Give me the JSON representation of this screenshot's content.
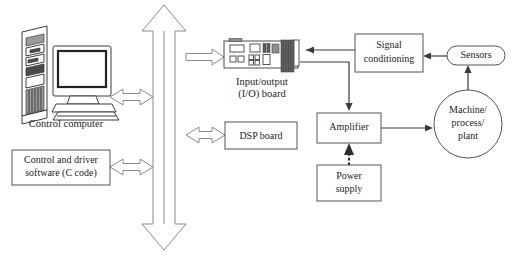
{
  "diagram": {
    "background_color": "#ffffff",
    "line_color": "#3a3a3a",
    "box_stroke_color": "#555555",
    "hollow_arrow_stroke": "#8a8a8a",
    "text_color": "#1d1d1d",
    "nodes": {
      "control_computer": {
        "label": "Control computer",
        "shape": "illustration-tower-and-monitor"
      },
      "control_software": {
        "label_line1": "Control and driver",
        "label_line2": "software (C code)",
        "shape": "rectangle"
      },
      "io_board": {
        "caption_line1": "Input/output",
        "caption_line2": "(I/O) board",
        "shape": "illustration-pcb-card"
      },
      "dsp_board": {
        "label": "DSP board",
        "shape": "rectangle"
      },
      "signal_conditioning": {
        "label_line1": "Signal",
        "label_line2": "conditioning",
        "shape": "rectangle"
      },
      "sensors": {
        "label": "Sensors",
        "shape": "stadium"
      },
      "amplifier": {
        "label": "Amplifier",
        "shape": "rectangle"
      },
      "power_supply": {
        "label_line1": "Power",
        "label_line2": "supply",
        "shape": "rectangle"
      },
      "machine": {
        "label_line1": "Machine/",
        "label_line2": "process/",
        "label_line3": "plant",
        "shape": "circle"
      },
      "system_bus": {
        "label": "",
        "shape": "vertical-double-headed-hollow-arrow"
      }
    },
    "connections": [
      {
        "from": "control_computer",
        "to": "system_bus",
        "style": "hollow-double-arrow",
        "orientation": "horizontal"
      },
      {
        "from": "control_software",
        "to": "system_bus",
        "style": "hollow-double-arrow",
        "orientation": "horizontal"
      },
      {
        "from": "system_bus",
        "to": "io_board",
        "style": "hollow-arrow",
        "orientation": "horizontal",
        "direction": "right"
      },
      {
        "from": "dsp_board",
        "to": "system_bus",
        "style": "hollow-double-arrow",
        "orientation": "horizontal"
      },
      {
        "from": "signal_conditioning",
        "to": "io_board",
        "style": "solid-arrow",
        "direction": "left"
      },
      {
        "from": "sensors",
        "to": "signal_conditioning",
        "style": "solid-arrow",
        "direction": "left"
      },
      {
        "from": "machine",
        "to": "sensors",
        "style": "solid-arrow",
        "direction": "up"
      },
      {
        "from": "io_board",
        "to": "amplifier",
        "style": "solid-arrow",
        "direction": "down"
      },
      {
        "from": "amplifier",
        "to": "machine",
        "style": "solid-arrow",
        "direction": "right"
      },
      {
        "from": "power_supply",
        "to": "amplifier",
        "style": "dashed-arrow",
        "direction": "up"
      }
    ]
  }
}
